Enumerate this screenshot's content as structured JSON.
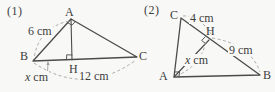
{
  "page": {
    "background": "#f8f8f6",
    "line_color": "#4b4b4b",
    "dash_color": "#a2a2a2",
    "text_color": "#3d3d3d"
  },
  "figure1": {
    "label": "(1)",
    "vertices": {
      "a": "A",
      "b": "B",
      "c": "C",
      "h": "H"
    },
    "measurements": {
      "side_ab": "6 cm",
      "side_bc": "12 cm",
      "seg_bh_var": "x",
      "seg_bh_unit": " cm"
    }
  },
  "figure2": {
    "label": "(2)",
    "vertices": {
      "a": "A",
      "b": "B",
      "c": "C",
      "h": "H"
    },
    "measurements": {
      "seg_ch": "4 cm",
      "seg_hb": "9 cm",
      "seg_ah_var": "x",
      "seg_ah_unit": " cm"
    }
  }
}
